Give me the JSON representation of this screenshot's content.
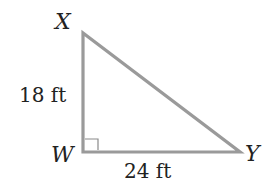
{
  "diagram": {
    "type": "right-triangle",
    "stroke_color": "#9a9a9a",
    "text_color": "#222222",
    "vertices": {
      "X": {
        "label": "X",
        "x": 83,
        "y": 33
      },
      "W": {
        "label": "W",
        "x": 83,
        "y": 152
      },
      "Y": {
        "label": "Y",
        "x": 240,
        "y": 152
      }
    },
    "right_angle_at": "W",
    "sides": {
      "XW": {
        "label": "18 ft",
        "length": 18,
        "unit": "ft"
      },
      "WY": {
        "label": "24 ft",
        "length": 24,
        "unit": "ft"
      }
    }
  }
}
